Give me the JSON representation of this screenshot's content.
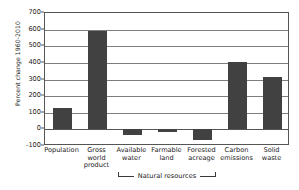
{
  "chart_data": {
    "type": "bar",
    "title": "",
    "xlabel": "",
    "ylabel": "Percent change 1960-2010",
    "ylim": [
      -100,
      700
    ],
    "yticks": [
      700,
      600,
      500,
      400,
      300,
      200,
      100,
      0,
      -100
    ],
    "ytick_labels": [
      "700",
      "600",
      "500",
      "400",
      "300",
      "200",
      "100",
      "0",
      "-100"
    ],
    "grid": true,
    "legend": "none",
    "categories": [
      "Population",
      "Gross world product",
      "Available water",
      "Farmable land",
      "Forested acreage",
      "Carbon emissions",
      "Solid waste"
    ],
    "category_labels": [
      "Population",
      "Gross\nworld\nproduct",
      "Available\nwater",
      "Farmable\nland",
      "Forested\nacreage",
      "Carbon\nemissions",
      "Solid\nwaste"
    ],
    "values": [
      130,
      590,
      -35,
      -15,
      -65,
      405,
      315
    ],
    "bar_color": "#414141",
    "group_annotation": {
      "label": "Natural resources",
      "covers": [
        "Available water",
        "Farmable land",
        "Forested acreage"
      ]
    }
  },
  "axis": {
    "frame_color": "#555555",
    "gridline_color": "#7d7d7d"
  }
}
